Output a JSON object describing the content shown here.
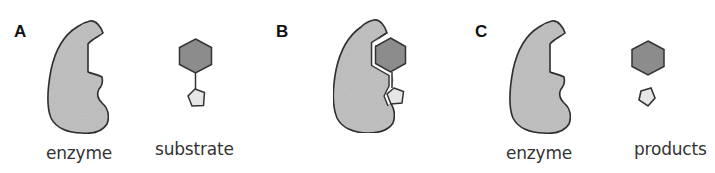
{
  "figure": {
    "panels": [
      {
        "label": "A",
        "captions": [
          "enzyme",
          "substrate"
        ],
        "description": "Enzyme and substrate shown separately"
      },
      {
        "label": "B",
        "captions": [],
        "description": "Substrate bound in the enzyme active site"
      },
      {
        "label": "C",
        "captions": [
          "enzyme",
          "products"
        ],
        "description": "Unchanged enzyme and two separate products"
      }
    ],
    "colors": {
      "enzyme_fill": "#c6c6c6",
      "hexagon_fill": "#8c8c8c",
      "pentagon_fill": "#e6e6e6",
      "stroke": "#333333",
      "background": "#ffffff"
    }
  }
}
